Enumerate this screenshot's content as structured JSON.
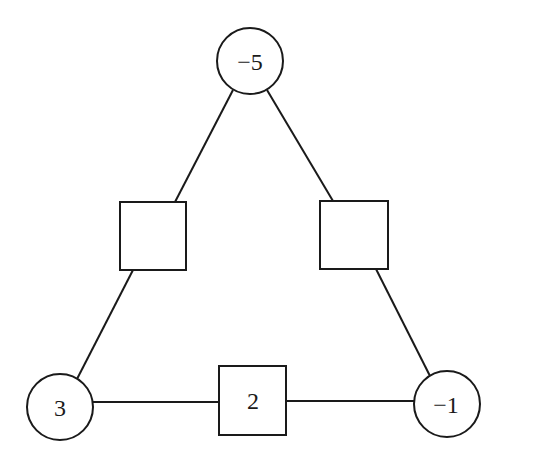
{
  "diagram": {
    "colors": {
      "stroke": "#1a1a1a",
      "background": "#ffffff"
    },
    "circles": [
      {
        "id": "top",
        "label": "−5",
        "cx": 250,
        "cy": 61,
        "r": 33
      },
      {
        "id": "bottom-left",
        "label": "3",
        "cx": 60,
        "cy": 407,
        "r": 33
      },
      {
        "id": "bottom-right",
        "label": "−1",
        "cx": 447,
        "cy": 404,
        "r": 33
      }
    ],
    "squares": [
      {
        "id": "left",
        "label": "",
        "x": 120,
        "y": 202,
        "w": 66,
        "h": 68
      },
      {
        "id": "right",
        "label": "",
        "x": 320,
        "y": 201,
        "w": 68,
        "h": 68
      },
      {
        "id": "bottom",
        "label": "2",
        "x": 219,
        "y": 366,
        "w": 67,
        "h": 69
      }
    ]
  }
}
